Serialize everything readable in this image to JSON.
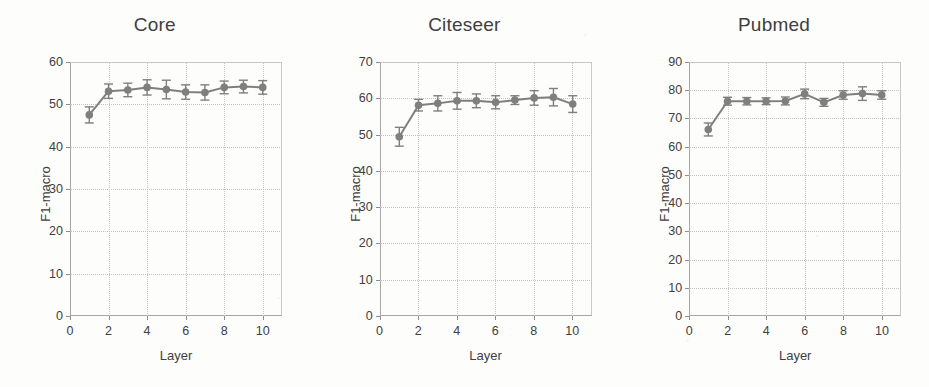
{
  "figure": {
    "background_color": "#fdfdfb",
    "series_color": "#7f7f7f",
    "grid_color": "#c6c6c6",
    "axis_color": "#a6a6a6",
    "text_color": "#3f3f3f"
  },
  "chart_data": [
    {
      "type": "line",
      "title": "Core",
      "xlabel": "Layer",
      "ylabel": "F1-macro",
      "xlim": [
        0,
        11
      ],
      "ylim": [
        0,
        60
      ],
      "xticks": [
        0,
        2,
        4,
        6,
        8,
        10
      ],
      "yticks": [
        0,
        10,
        20,
        30,
        40,
        50,
        60
      ],
      "grid": true,
      "legend": "none",
      "x": [
        1,
        2,
        3,
        4,
        5,
        6,
        7,
        8,
        9,
        10
      ],
      "values": [
        47.5,
        53.1,
        53.4,
        54.0,
        53.5,
        52.9,
        52.8,
        54.0,
        54.2,
        54.0
      ],
      "errors": [
        1.9,
        1.7,
        1.6,
        1.8,
        2.2,
        1.7,
        1.8,
        1.5,
        1.5,
        1.6
      ]
    },
    {
      "type": "line",
      "title": "Citeseer",
      "xlabel": "Layer",
      "ylabel": "F1-macro",
      "xlim": [
        0,
        11
      ],
      "ylim": [
        0,
        70
      ],
      "xticks": [
        0,
        2,
        4,
        6,
        8,
        10
      ],
      "yticks": [
        0,
        10,
        20,
        30,
        40,
        50,
        60,
        70
      ],
      "grid": true,
      "legend": "none",
      "x": [
        1,
        2,
        3,
        4,
        5,
        6,
        7,
        8,
        9,
        10
      ],
      "values": [
        49.4,
        58.1,
        58.6,
        59.3,
        59.3,
        58.9,
        59.5,
        60.1,
        60.3,
        58.4
      ],
      "errors": [
        2.6,
        1.6,
        2.1,
        2.3,
        1.9,
        1.8,
        1.2,
        2.0,
        2.4,
        2.3
      ]
    },
    {
      "type": "line",
      "title": "Pubmed",
      "xlabel": "Layer",
      "ylabel": "F1-macro",
      "xlim": [
        0,
        11
      ],
      "ylim": [
        0,
        90
      ],
      "xticks": [
        0,
        2,
        4,
        6,
        8,
        10
      ],
      "yticks": [
        0,
        10,
        20,
        30,
        40,
        50,
        60,
        70,
        80,
        90
      ],
      "grid": true,
      "legend": "none",
      "x": [
        1,
        2,
        3,
        4,
        5,
        6,
        7,
        8,
        9,
        10
      ],
      "values": [
        66.1,
        76.1,
        76.1,
        76.1,
        76.2,
        78.7,
        75.7,
        78.3,
        78.8,
        78.3
      ],
      "errors": [
        2.3,
        1.4,
        1.3,
        1.2,
        1.4,
        1.7,
        1.4,
        1.5,
        2.4,
        1.5
      ]
    }
  ]
}
